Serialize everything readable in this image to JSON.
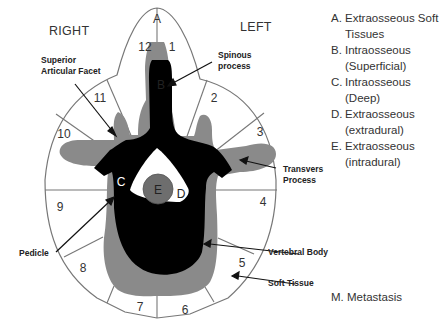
{
  "orientation": {
    "right_label": "RIGHT",
    "left_label": "LEFT"
  },
  "zones": {
    "A": "A",
    "B": "B",
    "C": "C",
    "D": "D",
    "E": "E"
  },
  "sectors": [
    "1",
    "2",
    "3",
    "4",
    "5",
    "6",
    "7",
    "8",
    "9",
    "10",
    "11",
    "12"
  ],
  "annotations": {
    "superior_articular_facet_line1": "Superior",
    "superior_articular_facet_line2": "Articular Facet",
    "spinous_process_line1": "Spinous",
    "spinous_process_line2": "process",
    "transvers_process_line1": "Transvers",
    "transvers_process_line2": "Process",
    "pedicle": "Pedicle",
    "vertebral_body": "Vertebral Body",
    "soft_tissue": "Soft Tissue"
  },
  "legend": {
    "items": [
      {
        "key": "A.",
        "text_line1": "Extraosseous Soft",
        "text_line2": "Tissues"
      },
      {
        "key": "B.",
        "text_line1": "Intraosseous",
        "text_line2": "(Superficial)"
      },
      {
        "key": "C.",
        "text_line1": "Intraosseous",
        "text_line2": "(Deep)"
      },
      {
        "key": "D.",
        "text_line1": "Extraosseous",
        "text_line2": "(extradural)"
      },
      {
        "key": "E.",
        "text_line1": "Extraosseous",
        "text_line2": "(intradural)"
      }
    ],
    "metastasis": "M. Metastasis"
  },
  "colors": {
    "bone": "#000000",
    "soft_tissue_gray": "#8a8a8a",
    "dura_gray": "#6e6e6e",
    "outline": "#777777",
    "canal": "#ffffff"
  }
}
